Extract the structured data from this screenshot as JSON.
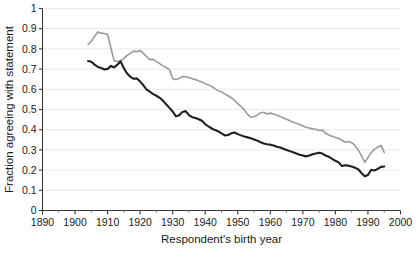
{
  "chart_data": {
    "type": "line",
    "title": "",
    "xlabel": "Respondent's birth year",
    "ylabel": "Fraction agreeing with statement",
    "xlim": [
      1890,
      2000
    ],
    "ylim": [
      0,
      1
    ],
    "grid": "horizontal",
    "legend_position": "none",
    "x_ticks": [
      "1890",
      "1900",
      "1910",
      "1920",
      "1930",
      "1940",
      "1950",
      "1960",
      "1970",
      "1980",
      "1990",
      "2000"
    ],
    "x_tick_values": [
      1890,
      1900,
      1910,
      1920,
      1930,
      1940,
      1950,
      1960,
      1970,
      1980,
      1990,
      2000
    ],
    "x_minor_tick_values": [
      1895,
      1905,
      1915,
      1925,
      1935,
      1945,
      1955,
      1965,
      1975,
      1985,
      1995
    ],
    "y_ticks": [
      "0",
      "0.1",
      "0.2",
      "0.3",
      "0.4",
      "0.5",
      "0.6",
      "0.7",
      "0.8",
      "0.9",
      "1"
    ],
    "y_tick_values": [
      0,
      0.1,
      0.2,
      0.3,
      0.4,
      0.5,
      0.6,
      0.7,
      0.8,
      0.9,
      1
    ],
    "series": [
      {
        "name": "upper-gray-series",
        "color": "#9a9a9a",
        "stroke_width": 1.6,
        "x": [
          1904,
          1905,
          1906,
          1907,
          1908,
          1909,
          1910,
          1911,
          1912,
          1913,
          1914,
          1915,
          1916,
          1917,
          1918,
          1919,
          1920,
          1921,
          1922,
          1923,
          1924,
          1925,
          1926,
          1927,
          1928,
          1929,
          1930,
          1931,
          1932,
          1933,
          1934,
          1935,
          1936,
          1937,
          1938,
          1939,
          1940,
          1941,
          1942,
          1943,
          1944,
          1945,
          1946,
          1947,
          1948,
          1949,
          1950,
          1951,
          1952,
          1953,
          1954,
          1955,
          1956,
          1957,
          1958,
          1959,
          1960,
          1961,
          1962,
          1963,
          1964,
          1965,
          1966,
          1967,
          1968,
          1969,
          1970,
          1971,
          1972,
          1973,
          1974,
          1975,
          1976,
          1977,
          1978,
          1979,
          1980,
          1981,
          1982,
          1983,
          1984,
          1985,
          1986,
          1987,
          1988,
          1989,
          1990,
          1991,
          1992,
          1993,
          1994,
          1995
        ],
        "y": [
          0.822,
          0.838,
          0.862,
          0.884,
          0.878,
          0.876,
          0.872,
          0.806,
          0.742,
          0.738,
          0.742,
          0.752,
          0.768,
          0.778,
          0.789,
          0.786,
          0.793,
          0.778,
          0.762,
          0.747,
          0.748,
          0.738,
          0.727,
          0.716,
          0.708,
          0.697,
          0.653,
          0.648,
          0.654,
          0.663,
          0.662,
          0.658,
          0.652,
          0.648,
          0.641,
          0.636,
          0.628,
          0.622,
          0.614,
          0.603,
          0.592,
          0.588,
          0.576,
          0.568,
          0.558,
          0.546,
          0.528,
          0.516,
          0.498,
          0.476,
          0.462,
          0.464,
          0.472,
          0.484,
          0.486,
          0.478,
          0.482,
          0.478,
          0.472,
          0.466,
          0.458,
          0.452,
          0.444,
          0.437,
          0.432,
          0.426,
          0.418,
          0.412,
          0.408,
          0.404,
          0.402,
          0.396,
          0.398,
          0.382,
          0.374,
          0.368,
          0.362,
          0.356,
          0.348,
          0.338,
          0.342,
          0.336,
          0.322,
          0.3,
          0.272,
          0.238,
          0.262,
          0.286,
          0.304,
          0.314,
          0.322,
          0.288
        ]
      },
      {
        "name": "lower-black-series",
        "color": "#1f1f1f",
        "stroke_width": 2.1,
        "x": [
          1904,
          1905,
          1906,
          1907,
          1908,
          1909,
          1910,
          1911,
          1912,
          1913,
          1914,
          1915,
          1916,
          1917,
          1918,
          1919,
          1920,
          1921,
          1922,
          1923,
          1924,
          1925,
          1926,
          1927,
          1928,
          1929,
          1930,
          1931,
          1932,
          1933,
          1934,
          1935,
          1936,
          1937,
          1938,
          1939,
          1940,
          1941,
          1942,
          1943,
          1944,
          1945,
          1946,
          1947,
          1948,
          1949,
          1950,
          1951,
          1952,
          1953,
          1954,
          1955,
          1956,
          1957,
          1958,
          1959,
          1960,
          1961,
          1962,
          1963,
          1964,
          1965,
          1966,
          1967,
          1968,
          1969,
          1970,
          1971,
          1972,
          1973,
          1974,
          1975,
          1976,
          1977,
          1978,
          1979,
          1980,
          1981,
          1982,
          1983,
          1984,
          1985,
          1986,
          1987,
          1988,
          1989,
          1990,
          1991,
          1992,
          1993,
          1994,
          1995
        ],
        "y": [
          0.74,
          0.736,
          0.722,
          0.711,
          0.706,
          0.698,
          0.701,
          0.716,
          0.708,
          0.722,
          0.738,
          0.704,
          0.678,
          0.662,
          0.652,
          0.654,
          0.638,
          0.62,
          0.598,
          0.588,
          0.576,
          0.568,
          0.558,
          0.544,
          0.526,
          0.508,
          0.49,
          0.466,
          0.472,
          0.488,
          0.492,
          0.472,
          0.462,
          0.458,
          0.452,
          0.444,
          0.428,
          0.416,
          0.406,
          0.398,
          0.392,
          0.382,
          0.372,
          0.374,
          0.382,
          0.386,
          0.378,
          0.372,
          0.366,
          0.362,
          0.358,
          0.352,
          0.346,
          0.338,
          0.332,
          0.328,
          0.326,
          0.322,
          0.316,
          0.312,
          0.306,
          0.3,
          0.294,
          0.288,
          0.282,
          0.276,
          0.272,
          0.268,
          0.272,
          0.278,
          0.282,
          0.286,
          0.282,
          0.272,
          0.266,
          0.256,
          0.246,
          0.238,
          0.22,
          0.224,
          0.222,
          0.218,
          0.212,
          0.204,
          0.186,
          0.17,
          0.176,
          0.202,
          0.198,
          0.206,
          0.216,
          0.218
        ]
      }
    ]
  }
}
